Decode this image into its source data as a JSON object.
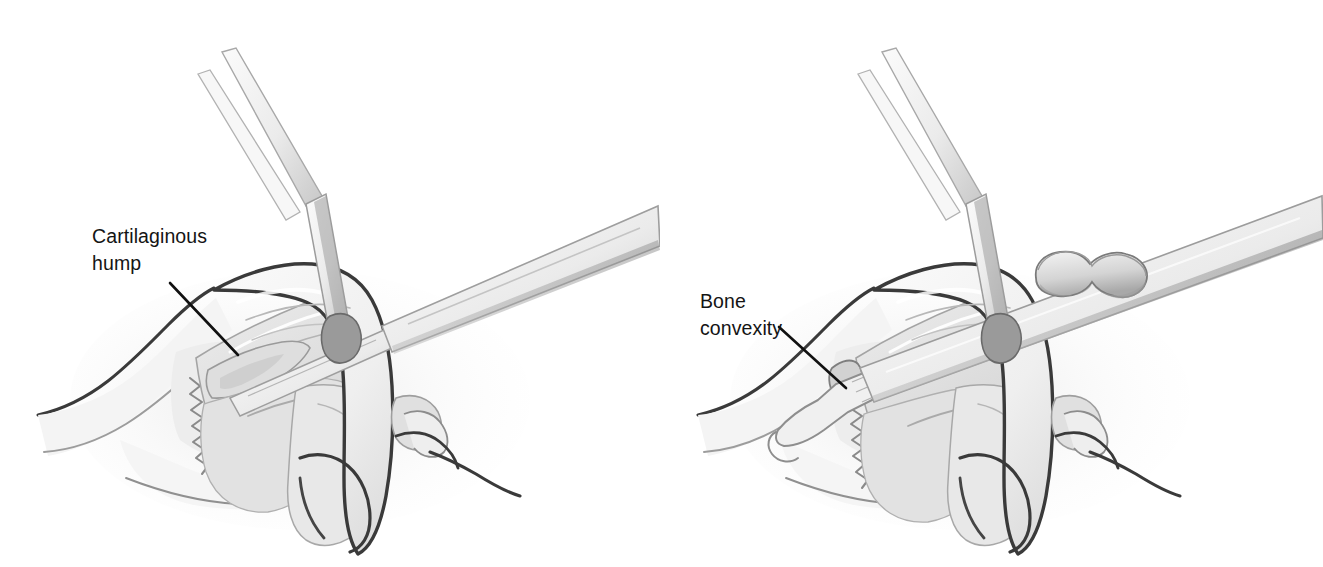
{
  "figure": {
    "background_color": "#ffffff",
    "panel_count": 2,
    "style": "grayscale medical line illustration with airbrush shading"
  },
  "palette": {
    "outline_dark": "#3a3a3a",
    "outline_mid": "#6e6e6e",
    "outline_light": "#9a9a9a",
    "fill_skin": "#f2f2f2",
    "fill_cartilage": "#e4e4e4",
    "fill_cartilage_deep": "#d8d8d8",
    "fill_instrument": "#ececec",
    "instrument_shadow": "#9c9c9c",
    "label_text": "#141414",
    "leader_line": "#111111"
  },
  "panels": [
    {
      "id": "panel-left",
      "name": "cartilaginous-hump-panel",
      "label": {
        "line1": "Cartilaginous",
        "line2": "hump",
        "text_x": 92,
        "text_y": 243,
        "leader_from": [
          170,
          283
        ],
        "leader_to": [
          238,
          355
        ]
      },
      "instruments": [
        {
          "name": "bayonet-retractor",
          "description": "angled double-prong skin hook retractor entering from top, bend at mid-shaft",
          "tip_location": "nasal dorsum at supratip"
        },
        {
          "name": "scalpel-blade",
          "description": "narrow blade on handle shaft entering from right, resting on dorsum",
          "tip_location": "cartilaginous dorsum"
        }
      ],
      "anatomy": [
        "retracted skin soft tissue envelope",
        "upper lateral cartilage",
        "septal cartilage dorsal hump",
        "lower lateral cartilage",
        "nasal bones with zigzag bony-cartilaginous junction",
        "nostril rim and columella",
        "upper lip"
      ]
    },
    {
      "id": "panel-right",
      "name": "bone-convexity-panel",
      "label": {
        "line1": "Bone",
        "line2": "convexity",
        "text_x": 700,
        "text_y": 308,
        "leader_from": [
          779,
          327
        ],
        "leader_to": [
          846,
          388
        ]
      },
      "instruments": [
        {
          "name": "bayonet-retractor",
          "description": "angled double-prong skin hook retractor entering from top, bend at mid-shaft",
          "tip_location": "nasal dorsum at supratip"
        },
        {
          "name": "rasp",
          "description": "flat straight rasp shaft with peanut-shaped bulbous handle grip, striated working surface",
          "tip_location": "bony dorsum at radix"
        }
      ],
      "anatomy": [
        "retracted skin soft tissue envelope",
        "upper lateral cartilage",
        "residual bony convexity at keystone",
        "lower lateral cartilage",
        "nasal bones with zigzag bony-cartilaginous junction",
        "nostril rim and columella",
        "upper lip"
      ]
    }
  ]
}
